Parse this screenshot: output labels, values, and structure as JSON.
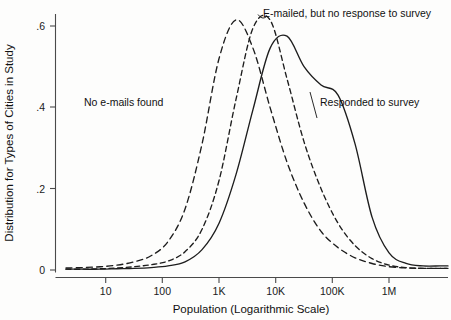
{
  "chart_data": {
    "type": "line",
    "title": "",
    "subtitle": "",
    "xlabel": "Population (Logarithmic Scale)",
    "ylabel": "Distribution for Types of Cities in Study",
    "x_scale": "log",
    "xlim": [
      1.5,
      10000000
    ],
    "ylim": [
      0,
      0.64
    ],
    "x_tick_labels": [
      "10",
      "100",
      "1K",
      "10K",
      "100K",
      "1M"
    ],
    "x_tick_values": [
      10,
      100,
      1000,
      10000,
      100000,
      1000000
    ],
    "y_tick_labels": [
      "0",
      ".2",
      ".4",
      ".6"
    ],
    "y_tick_values": [
      0,
      0.2,
      0.4,
      0.6
    ],
    "grid": false,
    "legend_position": "inline-annotations",
    "x_log10_points": [
      0.3,
      0.6,
      0.9,
      1.2,
      1.5,
      1.8,
      2.1,
      2.4,
      2.7,
      3.0,
      3.3,
      3.6,
      3.9,
      4.2,
      4.5,
      4.8,
      5.1,
      5.4,
      5.7,
      6.0,
      6.3,
      6.6,
      6.9
    ],
    "series": [
      {
        "name": "No e-mails found",
        "style": "dashed",
        "color": "#1d1d1d",
        "peak_x": 700,
        "peak_y": 0.615,
        "label_x_log10": 2.15,
        "label_y": 0.4,
        "values": [
          0.005,
          0.006,
          0.008,
          0.012,
          0.02,
          0.035,
          0.07,
          0.15,
          0.31,
          0.52,
          0.615,
          0.545,
          0.4,
          0.265,
          0.165,
          0.095,
          0.055,
          0.03,
          0.016,
          0.008,
          0.005,
          0.004,
          0.004
        ]
      },
      {
        "name": "E-mailed, but no response to survey",
        "style": "dashed",
        "color": "#1d1d1d",
        "peak_x": 2100,
        "peak_y": 0.615,
        "label_x_log10": 4.05,
        "label_y": 0.625,
        "values": [
          0.002,
          0.002,
          0.003,
          0.005,
          0.008,
          0.013,
          0.022,
          0.045,
          0.1,
          0.22,
          0.42,
          0.595,
          0.615,
          0.47,
          0.315,
          0.2,
          0.115,
          0.06,
          0.028,
          0.012,
          0.006,
          0.004,
          0.004
        ]
      },
      {
        "name": "Responded to survey",
        "style": "solid",
        "color": "#1d1d1d",
        "peak_x": 9000,
        "peak_y": 0.575,
        "label_x_log10": 4.95,
        "label_y": 0.4,
        "values": [
          0.002,
          0.002,
          0.002,
          0.003,
          0.004,
          0.006,
          0.01,
          0.02,
          0.05,
          0.115,
          0.235,
          0.395,
          0.545,
          0.575,
          0.5,
          0.455,
          0.43,
          0.31,
          0.13,
          0.042,
          0.016,
          0.01,
          0.01
        ]
      }
    ],
    "annotations": [
      {
        "text": "No e-mails found",
        "anchor": "start"
      },
      {
        "text": "E-mailed, but no response to survey",
        "anchor": "start"
      },
      {
        "text": "Responded to survey",
        "anchor": "start"
      }
    ]
  },
  "axes": {
    "x_title": "Population (Logarithmic Scale)",
    "y_title": "Distribution for Types of Cities in Study",
    "x_ticks": [
      "10",
      "100",
      "1K",
      "10K",
      "100K",
      "1M"
    ],
    "y_ticks": [
      "0",
      ".2",
      ".4",
      ".6"
    ]
  },
  "labels": {
    "series_no_emails": "No e-mails found",
    "series_emailed": "E-mailed, but no response to survey",
    "series_responded": "Responded to survey"
  }
}
